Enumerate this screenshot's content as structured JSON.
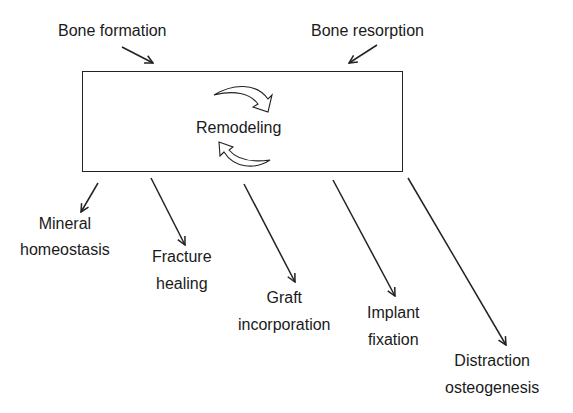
{
  "diagram": {
    "central": {
      "label": "Remodeling"
    },
    "inputs": [
      {
        "label": "Bone formation"
      },
      {
        "label": "Bone resorption"
      }
    ],
    "outputs": [
      {
        "line1": "Mineral",
        "line2": "homeostasis"
      },
      {
        "line1": "Fracture",
        "line2": "healing"
      },
      {
        "line1": "Graft",
        "line2": "incorporation"
      },
      {
        "line1": "Implant",
        "line2": "fixation"
      },
      {
        "line1": "Distraction",
        "line2": "osteogenesis"
      }
    ]
  }
}
